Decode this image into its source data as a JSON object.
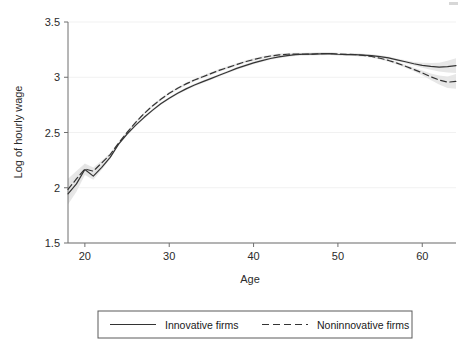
{
  "chart_data": {
    "type": "line",
    "title": "",
    "xlabel": "Age",
    "ylabel": "Log of hourly wage",
    "xlim": [
      18,
      64
    ],
    "ylim": [
      1.5,
      3.5
    ],
    "xticks": [
      20,
      30,
      40,
      50,
      60
    ],
    "yticks": [
      1.5,
      2,
      2.5,
      3,
      3.5
    ],
    "xtick_labels": [
      "20",
      "30",
      "40",
      "50",
      "60"
    ],
    "ytick_labels": [
      "1.5",
      "2",
      "2.5",
      "3",
      "3.5"
    ],
    "grid": "horizontal-faint",
    "legend_position": "below-plot",
    "x": [
      18,
      19,
      20,
      21,
      22,
      23,
      24,
      25,
      26,
      27,
      28,
      29,
      30,
      31,
      32,
      33,
      34,
      35,
      36,
      37,
      38,
      39,
      40,
      41,
      42,
      43,
      44,
      45,
      46,
      47,
      48,
      49,
      50,
      51,
      52,
      53,
      54,
      55,
      56,
      57,
      58,
      59,
      60,
      61,
      62,
      63,
      64
    ],
    "series": [
      {
        "name": "Innovative firms",
        "style": "solid",
        "color": "#333333",
        "values": [
          1.945,
          2.035,
          2.165,
          2.105,
          2.185,
          2.275,
          2.395,
          2.485,
          2.565,
          2.635,
          2.7,
          2.76,
          2.81,
          2.855,
          2.895,
          2.93,
          2.96,
          2.99,
          3.02,
          3.05,
          3.08,
          3.105,
          3.13,
          3.15,
          3.17,
          3.185,
          3.196,
          3.205,
          3.209,
          3.21,
          3.212,
          3.213,
          3.208,
          3.205,
          3.204,
          3.2,
          3.196,
          3.186,
          3.175,
          3.158,
          3.14,
          3.122,
          3.108,
          3.098,
          3.092,
          3.096,
          3.105
        ],
        "ci_band": true
      },
      {
        "name": "Noninnovative firms",
        "style": "dashed",
        "color": "#333333",
        "values": [
          1.985,
          2.08,
          2.17,
          2.15,
          2.225,
          2.3,
          2.405,
          2.5,
          2.59,
          2.67,
          2.74,
          2.8,
          2.855,
          2.9,
          2.94,
          2.975,
          3.005,
          3.035,
          3.065,
          3.09,
          3.115,
          3.14,
          3.16,
          3.178,
          3.192,
          3.202,
          3.208,
          3.21,
          3.208,
          3.21,
          3.214,
          3.215,
          3.21,
          3.208,
          3.205,
          3.198,
          3.188,
          3.172,
          3.152,
          3.128,
          3.1,
          3.07,
          3.04,
          3.005,
          2.975,
          2.955,
          2.962
        ],
        "ci_band": true
      }
    ],
    "band_color": "#e3e3e3",
    "axis_color": "#6f6f6f"
  },
  "legend": {
    "items": [
      {
        "label": "Innovative firms",
        "style": "solid"
      },
      {
        "label": "Noninnovative firms",
        "style": "dashed"
      }
    ]
  },
  "axes": {
    "x_title": "Age",
    "y_title": "Log of hourly wage"
  }
}
